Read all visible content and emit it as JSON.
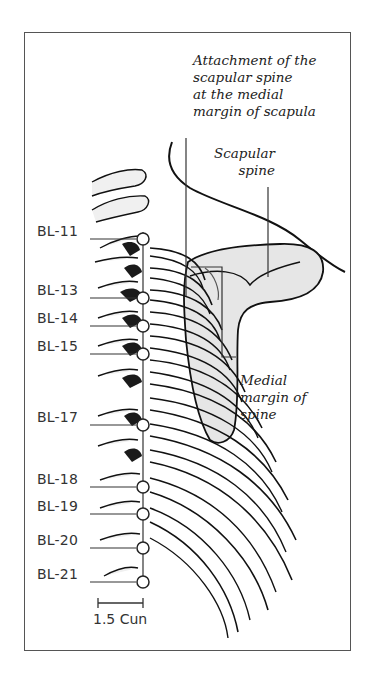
{
  "figure": {
    "annotations": {
      "attachment": [
        "Attachment of the",
        "scapular spine",
        "at the medial",
        "margin of scapula"
      ],
      "scapular_spine": [
        "Scapular",
        "spine"
      ],
      "medial_margin": [
        "Medial",
        "margin of",
        "spine"
      ]
    },
    "points": [
      {
        "label": "BL-11",
        "y": 239
      },
      {
        "label": "BL-13",
        "y": 298
      },
      {
        "label": "BL-14",
        "y": 326
      },
      {
        "label": "BL-15",
        "y": 354
      },
      {
        "label": "BL-17",
        "y": 425
      },
      {
        "label": "BL-18",
        "y": 487
      },
      {
        "label": "BL-19",
        "y": 514
      },
      {
        "label": "BL-20",
        "y": 548
      },
      {
        "label": "BL-21",
        "y": 582
      }
    ],
    "scale_bar": {
      "label": "1.5 Cun"
    },
    "colors": {
      "line": "#222222",
      "frame": "#555555",
      "bone_shade": "#d9d9d9",
      "dark_shade": "#1a1a1a"
    }
  }
}
